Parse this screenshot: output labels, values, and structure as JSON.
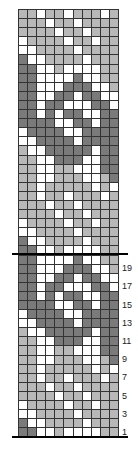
{
  "chart": {
    "title": "",
    "columns": 11,
    "rows_total": 47,
    "colors": {
      "D": "#7a7a7a",
      "L": "#b8b8b8",
      "W": "#ffffff"
    },
    "repeat_rows_bottom_to_top": [
      "DDWWLWWWWLL",
      "DWWLLLLWLLL",
      "WWLLLLWLLLL",
      "WLLLLWLLWLL",
      "LLLLWLLWLLL",
      "LLLWLLWLLLL",
      "LLWLLWLLLWL",
      "LLWLLLLLWLW",
      "LLWWLLLWWLD",
      "LLWWLLWWWDD",
      "LLWWDDDWWDD",
      "LWWDDDDDWDD",
      "WWDDDDWDDDD",
      "WDDDDWWDDDD",
      "DDDDWWDDWDD",
      "DDWDWDDWWDD",
      "DDWDDWWWDDW",
      "DDWWDDWDDWW",
      "DDWWWDDDWWL",
      "DDWWWWDWWLL"
    ],
    "row_labels": [
      "1",
      "3",
      "5",
      "7",
      "9",
      "11",
      "13",
      "15",
      "17",
      "19"
    ],
    "thick_line_after_row": 20
  },
  "chart_data": {
    "type": "table",
    "columns": 11,
    "rows": 47,
    "row_labels": [
      "1",
      "3",
      "5",
      "7",
      "9",
      "11",
      "13",
      "15",
      "17",
      "19"
    ],
    "legend": {
      "D": "dark gray",
      "L": "light gray",
      "W": "white"
    }
  }
}
